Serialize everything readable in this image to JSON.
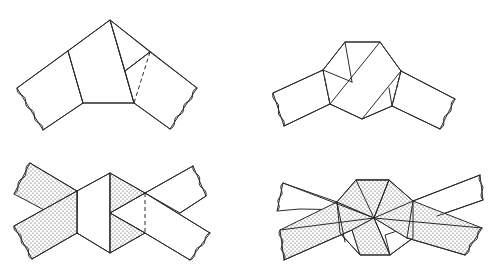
{
  "diagram": {
    "title": "",
    "colors": {
      "line": "#2a2a2a",
      "background": "#ffffff",
      "stipple_dot": "#3a3a3a"
    },
    "panels": [
      {
        "id": "panel-1",
        "position": "top-left",
        "caption": "",
        "white_polys": [
          "17,88 68,51 83,103 43,130",
          "68,51 110,20 134,103 83,103",
          "110,20 150,52 125,71",
          "150,52 197,88 170,129 134,103 125,71"
        ],
        "lines": [
          "17,88 110,20 197,88",
          "68,51 83,103",
          "83,103 134,103",
          "110,20 134,103",
          "125,71 150,52",
          "134,103 170,129",
          "83,103 43,130"
        ],
        "dashed": [
          "150,52 134,103"
        ],
        "wavy_ends": [
          {
            "from": [
              17,
              88
            ],
            "to": [
              43,
              130
            ]
          },
          {
            "from": [
              197,
              88
            ],
            "to": [
              170,
              129
            ]
          }
        ]
      },
      {
        "id": "panel-2",
        "position": "top-right",
        "caption": "",
        "white_polys": [
          "273,93 323,70 330,104 284,126",
          "323,70 345,42 380,42 401,71 392,106 362,119 330,104",
          "401,71 455,99 440,129 392,106"
        ],
        "lines": [
          "273,93 323,70 345,42 380,42 401,71 455,99",
          "284,126 330,104 362,119 392,106 440,129",
          "345,42 352,82",
          "323,70 352,82",
          "380,42 330,104",
          "401,71 362,119",
          "389,88 392,106"
        ],
        "dashed": [
          "323,70 330,104",
          "401,71 392,106"
        ],
        "wavy_ends": [
          {
            "from": [
              273,
              93
            ],
            "to": [
              284,
              126
            ]
          },
          {
            "from": [
              455,
              99
            ],
            "to": [
              440,
              129
            ]
          }
        ]
      },
      {
        "id": "panel-3",
        "position": "bottom-left",
        "caption": "",
        "stippled_polys": [
          "30,163 77,191 77,213 48,212 14,194",
          "14,226 77,191 77,233 32,259",
          "110,173 145,193 110,213",
          "110,213 145,233 110,253"
        ],
        "white_polys": [
          "77,191 110,173 110,253 77,233",
          "145,193 193,166 206,196 180,213 145,193",
          "110,213 145,193 210,233 190,260 145,233"
        ],
        "lines": [
          "30,163 77,191",
          "14,226 77,191",
          "32,259 77,233",
          "77,191 110,173 145,193 193,166",
          "77,233 110,253 145,233 190,260",
          "77,191 77,233",
          "110,173 110,253",
          "110,213 145,193",
          "110,213 145,233",
          "145,193 210,233",
          "180,213 206,196"
        ],
        "dashed": [
          "145,193 145,233"
        ],
        "wavy_ends": [
          {
            "from": [
              30,
              163
            ],
            "to": [
              14,
              194
            ]
          },
          {
            "from": [
              14,
              226
            ],
            "to": [
              32,
              259
            ]
          },
          {
            "from": [
              193,
              166
            ],
            "to": [
              206,
              196
            ]
          },
          {
            "from": [
              210,
              233
            ],
            "to": [
              190,
              260
            ]
          }
        ]
      },
      {
        "id": "panel-4",
        "position": "bottom-right",
        "caption": "",
        "white_polys": [
          "283,183 337,202 351,210 300,209 277,211",
          "413,201 480,175 483,200 437,216",
          "340,233 352,230 360,255",
          "390,255 413,238 400,230 385,235",
          "356,180 389,180 382,184"
        ],
        "stippled_polys": [
          "280,230 337,202 374,218 352,230 284,260",
          "337,202 356,180 389,180 374,218",
          "389,180 413,201 407,238 374,218",
          "352,230 374,218 390,255 360,255",
          "374,218 413,201 482,228 465,255 407,238"
        ],
        "lines": [
          "283,183 374,218 482,228",
          "280,230 374,218",
          "284,260 352,230",
          "337,202 356,180 389,180 413,201",
          "337,202 340,233 360,255 390,255 413,238 413,201",
          "356,180 374,218",
          "389,180 374,218",
          "374,218 390,255",
          "337,202 345,242",
          "413,201 407,238",
          "413,201 480,175",
          "437,216 483,200",
          "407,238 465,255"
        ],
        "dashed": [],
        "wavy_ends": [
          {
            "from": [
              283,
              183
            ],
            "to": [
              277,
              211
            ]
          },
          {
            "from": [
              280,
              230
            ],
            "to": [
              284,
              260
            ]
          },
          {
            "from": [
              480,
              175
            ],
            "to": [
              483,
              200
            ]
          },
          {
            "from": [
              482,
              228
            ],
            "to": [
              465,
              255
            ]
          }
        ]
      }
    ]
  }
}
